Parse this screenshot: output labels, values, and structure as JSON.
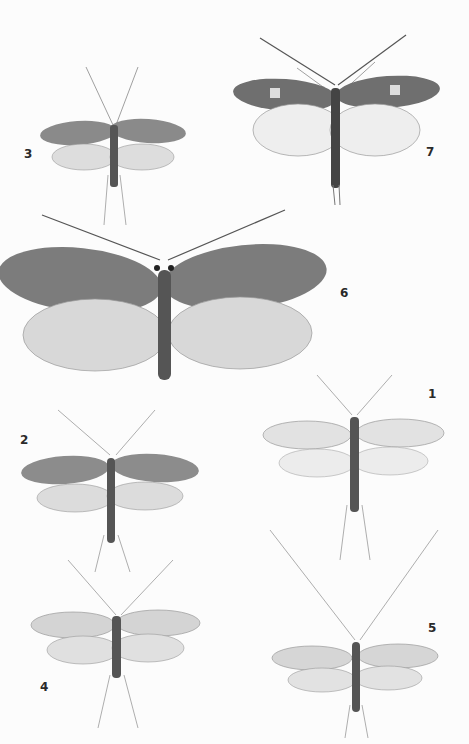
{
  "plate": {
    "background": "#fcfcfc",
    "specimens": [
      {
        "number": "1",
        "label_x": 428,
        "label_y": 387
      },
      {
        "number": "2",
        "label_x": 20,
        "label_y": 433
      },
      {
        "number": "3",
        "label_x": 24,
        "label_y": 147
      },
      {
        "number": "4",
        "label_x": 40,
        "label_y": 680
      },
      {
        "number": "5",
        "label_x": 428,
        "label_y": 621
      },
      {
        "number": "6",
        "label_x": 340,
        "label_y": 286
      },
      {
        "number": "7",
        "label_x": 426,
        "label_y": 145
      }
    ]
  }
}
